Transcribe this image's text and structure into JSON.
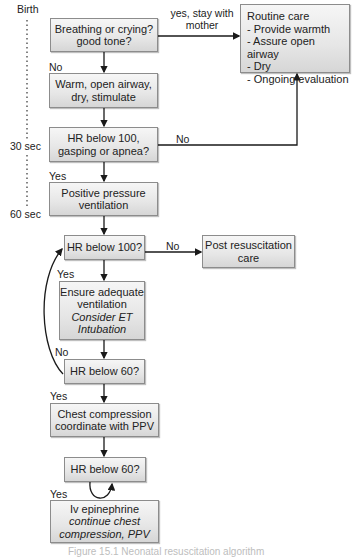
{
  "timeline": {
    "birth": "Birth",
    "t30": "30 sec",
    "t60": "60 sec"
  },
  "nodes": {
    "breathing": {
      "lines": [
        "Breathing or crying?",
        "good tone?"
      ]
    },
    "warm": {
      "lines": [
        "Warm, open airway,",
        "dry, stimulate"
      ]
    },
    "hr100_first": {
      "lines": [
        "HR below 100,",
        "gasping or apnea?"
      ]
    },
    "ppv": {
      "lines": [
        "Positive pressure",
        "ventilation"
      ]
    },
    "hr100_second": {
      "lines": [
        "HR below 100?"
      ]
    },
    "post_resus": {
      "lines": [
        "Post resuscitation",
        "care"
      ]
    },
    "ensure": {
      "lines": [
        "Ensure adequate",
        "ventilation"
      ],
      "italic_lines": [
        "Consider ET",
        "Intubation"
      ]
    },
    "hr60_first": {
      "lines": [
        "HR below 60?"
      ]
    },
    "chest": {
      "lines": [
        "Chest compression",
        "coordinate with PPV"
      ]
    },
    "hr60_second": {
      "lines": [
        "HR below 60?"
      ]
    },
    "epi": {
      "lines": [
        "Iv epinephrine"
      ],
      "italic_lines": [
        "continue chest",
        "compression, PPV"
      ]
    },
    "routine": {
      "title": "Routine care",
      "items": [
        "- Provide warmth",
        "- Assure open airway",
        "- Dry",
        "- Ongoing evaluation"
      ]
    }
  },
  "edge_labels": {
    "yes_stay": [
      "yes, stay with",
      "mother"
    ],
    "no_1": "No",
    "no_2": "No",
    "yes_1": "Yes",
    "no_3": "No",
    "yes_2": "Yes",
    "no_4": "No",
    "yes_3": "Yes",
    "yes_4": "Yes"
  },
  "caption": "Figure 15.1 Neonatal resuscitation algorithm",
  "colors": {
    "box_border": "#8c8c8c",
    "box_fill_top": "#f6f6f6",
    "box_fill_bottom": "#d6d6d6",
    "line": "#1a1a1a"
  }
}
